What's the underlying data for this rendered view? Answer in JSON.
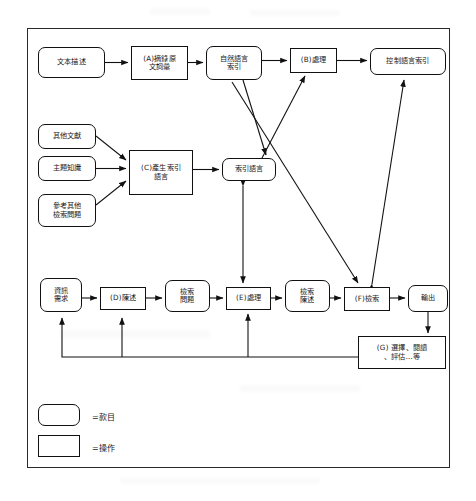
{
  "diagram": {
    "type": "flowchart",
    "nodes": [
      {
        "id": "text_desc",
        "label": "文本描述",
        "shape": "entry",
        "x": 38,
        "y": 47,
        "w": 67,
        "h": 31
      },
      {
        "id": "a_extract",
        "label": "(A)摘錄原\n文詞彙",
        "shape": "operation",
        "x": 131,
        "y": 46,
        "w": 57,
        "h": 34
      },
      {
        "id": "nl_index",
        "label": "自然語言\n索引",
        "shape": "entry",
        "x": 206,
        "y": 46,
        "w": 56,
        "h": 34
      },
      {
        "id": "b_process",
        "label": "(B)處理",
        "shape": "operation",
        "x": 290,
        "y": 48,
        "w": 47,
        "h": 25
      },
      {
        "id": "ctrl_index",
        "label": "控制語言索引",
        "shape": "entry",
        "x": 370,
        "y": 48,
        "w": 76,
        "h": 27
      },
      {
        "id": "other_docs",
        "label": "其他文獻",
        "shape": "entry",
        "x": 38,
        "y": 124,
        "w": 58,
        "h": 25
      },
      {
        "id": "topic_know",
        "label": "主題知識",
        "shape": "entry",
        "x": 38,
        "y": 156,
        "w": 58,
        "h": 25
      },
      {
        "id": "ref_other_q",
        "label": "參考其他\n檢索問題",
        "shape": "entry",
        "x": 38,
        "y": 194,
        "w": 58,
        "h": 33
      },
      {
        "id": "c_gen_lang",
        "label": "(C)產生索引\n語言",
        "shape": "operation",
        "x": 129,
        "y": 150,
        "w": 64,
        "h": 45
      },
      {
        "id": "index_lang",
        "label": "索引語言",
        "shape": "entry",
        "x": 222,
        "y": 158,
        "w": 54,
        "h": 23
      },
      {
        "id": "info_need",
        "label": "資訊\n需求",
        "shape": "entry",
        "x": 40,
        "y": 278,
        "w": 42,
        "h": 34
      },
      {
        "id": "d_state",
        "label": "(D)陳述",
        "shape": "operation",
        "x": 100,
        "y": 287,
        "w": 46,
        "h": 23
      },
      {
        "id": "search_q",
        "label": "檢索\n問題",
        "shape": "entry",
        "x": 165,
        "y": 280,
        "w": 45,
        "h": 32
      },
      {
        "id": "e_process",
        "label": "(E)處理",
        "shape": "operation",
        "x": 226,
        "y": 287,
        "w": 45,
        "h": 23
      },
      {
        "id": "search_stmt",
        "label": "檢索\n陳述",
        "shape": "entry",
        "x": 285,
        "y": 280,
        "w": 45,
        "h": 32
      },
      {
        "id": "f_retrieve",
        "label": "(F)檢索",
        "shape": "operation",
        "x": 344,
        "y": 287,
        "w": 46,
        "h": 24
      },
      {
        "id": "output",
        "label": "輸出",
        "shape": "entry",
        "x": 408,
        "y": 285,
        "w": 40,
        "h": 27
      },
      {
        "id": "g_select",
        "label": "(G) 選擇、閱讀\n、評估…等",
        "shape": "operation",
        "x": 358,
        "y": 336,
        "w": 88,
        "h": 33
      }
    ],
    "legend": [
      {
        "shape": "entry",
        "text": "=款目"
      },
      {
        "shape": "operation",
        "text": "=操作"
      }
    ]
  }
}
